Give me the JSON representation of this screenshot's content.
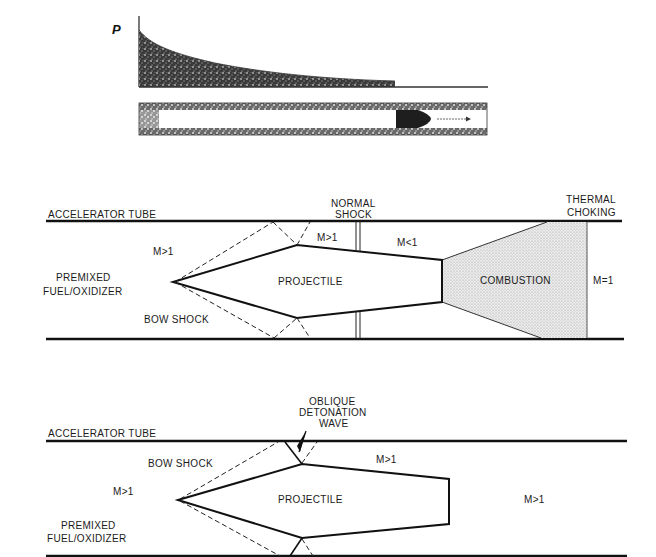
{
  "figure": {
    "panel_top": {
      "pressure_axis_label": "P",
      "description": "Pressure profile behind projectile in gun barrel"
    },
    "panel_thermal_choking": {
      "tube_label": "ACCELERATOR TUBE",
      "normal_shock_label_1": "NORMAL",
      "normal_shock_label_2": "SHOCK",
      "thermal_choking_label_1": "THERMAL",
      "thermal_choking_label_2": "CHOKING",
      "mach_upstream": "M>1",
      "mach_before_shock": "M>1",
      "mach_after_shock": "M<1",
      "mach_choke": "M=1",
      "fuel_label_1": "PREMIXED",
      "fuel_label_2": "FUEL/OXIDIZER",
      "bow_shock_label": "BOW SHOCK",
      "projectile_label": "PROJECTILE",
      "combustion_label": "COMBUSTION"
    },
    "panel_oblique_detonation": {
      "tube_label": "ACCELERATOR TUBE",
      "detonation_label_1": "OBLIQUE",
      "detonation_label_2": "DETONATION",
      "detonation_label_3": "WAVE",
      "bow_shock_label": "BOW SHOCK",
      "mach_upstream": "M>1",
      "mach_top": "M>1",
      "mach_wake": "M>1",
      "fuel_label_1": "PREMIXED",
      "fuel_label_2": "FUEL/OXIDIZER",
      "projectile_label": "PROJECTILE"
    }
  }
}
